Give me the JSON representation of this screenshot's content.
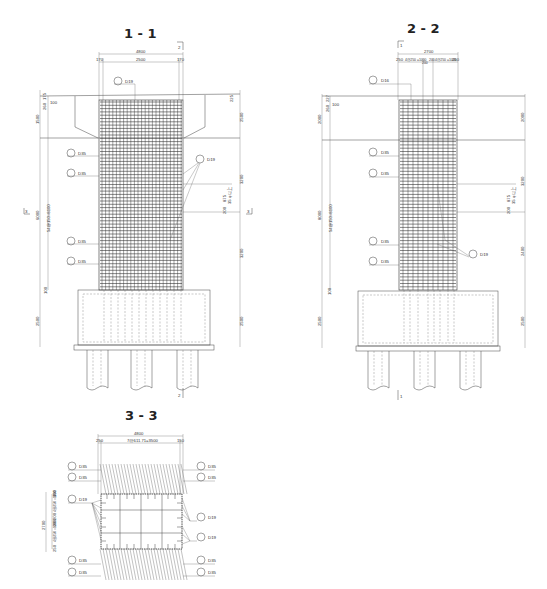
{
  "sections": [
    {
      "id": "1-1",
      "title": "1 - 1",
      "cut_marker_top": "2",
      "cut_marker_bottom": "2",
      "side_marker_left": "3",
      "side_marker_right": "3",
      "top_dims": {
        "overall": "4800",
        "inner": "2500",
        "left_cover": "170",
        "right_cover": "170"
      },
      "left_dims": {
        "top_small": "175",
        "cover_a": "260",
        "cover_b": "100",
        "cap_height": "1500",
        "bar_spacing": "54@150=8100",
        "total": "6000",
        "base_small": "100",
        "footing": "2500"
      },
      "right_dims": {
        "top_small": "225",
        "cap": "2500",
        "mid": "3200",
        "lower": "3200",
        "footing": "2500",
        "note_a": "200",
        "note_b": "875",
        "note_c": "35 φ以上"
      },
      "bar_labels": [
        {
          "mark": "D19",
          "num": "1"
        },
        {
          "mark": "D35",
          "num": "2"
        },
        {
          "mark": "D35",
          "num": "3"
        },
        {
          "mark": "D35",
          "num": "4"
        },
        {
          "mark": "D35",
          "num": "5"
        },
        {
          "mark": "D19",
          "num": "6"
        }
      ]
    },
    {
      "id": "2-2",
      "title": "2 - 2",
      "cut_marker_top": "1",
      "cut_marker_bottom": "1",
      "top_dims": {
        "overall": "2700",
        "left_cover": "250",
        "left_group": "4@250 =1000",
        "center_a": "200",
        "center_b": "200",
        "right_group": "4@250 =1000",
        "right_cover": "250"
      },
      "left_dims": {
        "top_small": "227",
        "cover_a": "260",
        "cover_b": "100",
        "cap_height": "2000",
        "bar_spacing": "54@150=8100",
        "total": "8000",
        "base_small": "100",
        "footing": "2500"
      },
      "right_dims": {
        "cap": "2000",
        "mid": "3200",
        "lower": "2400",
        "footing": "2500",
        "note_a": "200",
        "note_b": "875",
        "note_c": "35 φ以上"
      },
      "bar_labels": [
        {
          "mark": "D16",
          "num": "1"
        },
        {
          "mark": "D35",
          "num": "2"
        },
        {
          "mark": "D35",
          "num": "3"
        },
        {
          "mark": "D35",
          "num": "4"
        },
        {
          "mark": "D35",
          "num": "5"
        },
        {
          "mark": "D19",
          "num": "6"
        }
      ]
    },
    {
      "id": "3-3",
      "title": "3 - 3",
      "top_dims": {
        "overall": "4800",
        "inner": "7@611.71=3500",
        "left_cover": "250",
        "right_cover": "150"
      },
      "left_dims": {
        "total": "2700",
        "a": "150",
        "b": "4@250 =1000",
        "c": "200",
        "d": "200",
        "e": "4@250 =1000",
        "f": "250"
      },
      "left_labels": [
        {
          "mark": "D35",
          "num": "1"
        },
        {
          "mark": "D35",
          "num": "2"
        },
        {
          "mark": "D19",
          "num": "3"
        },
        {
          "mark": "D35",
          "num": "4"
        },
        {
          "mark": "D35",
          "num": "5"
        }
      ],
      "right_labels": [
        {
          "mark": "D35",
          "num": "1"
        },
        {
          "mark": "D35",
          "num": "2"
        },
        {
          "mark": "D19",
          "num": "3"
        },
        {
          "mark": "D19",
          "num": "4"
        },
        {
          "mark": "D35",
          "num": "5"
        },
        {
          "mark": "D35",
          "num": "6"
        }
      ]
    }
  ]
}
